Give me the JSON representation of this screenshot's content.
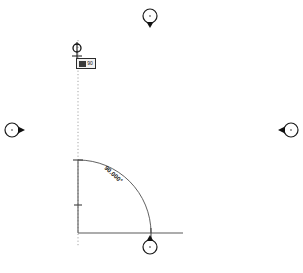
{
  "app": {
    "type": "cad-angular-dimension-editor",
    "background_color": "#ffffff",
    "line_color": "#555555",
    "construction_line_color": "#9a9a9a",
    "handle_color": "#1a1a1a"
  },
  "drawing": {
    "title": "Angular dimension",
    "center": {
      "x": 78,
      "y": 233
    },
    "radius": 73,
    "vertical_leg": {
      "x1": 78,
      "y1": 160,
      "x2": 78,
      "y2": 233
    },
    "horizontal_leg": {
      "x1": 78,
      "y1": 233,
      "x2": 183,
      "y2": 233
    },
    "construction_line": {
      "x": 78,
      "y_top": 40,
      "y_bottom": 246
    },
    "arc": {
      "start_x": 78,
      "start_y": 160,
      "end_x": 151,
      "end_y": 233
    }
  },
  "annotations": {
    "angle_label": "90.000°",
    "value_box": {
      "text": "90",
      "visible": true
    }
  },
  "handles": [
    {
      "name": "grip-top",
      "cx": 150,
      "cy": 17,
      "r": 7,
      "arrow": "down"
    },
    {
      "name": "grip-left",
      "cx": 13,
      "cy": 130,
      "r": 7,
      "arrow": "right"
    },
    {
      "name": "grip-right",
      "cx": 290,
      "cy": 130,
      "r": 7,
      "arrow": "left"
    },
    {
      "name": "grip-bottom",
      "cx": 150,
      "cy": 246,
      "r": 7,
      "arrow": "up"
    },
    {
      "name": "grip-selection",
      "cx": 77,
      "cy": 48,
      "r": 4,
      "arrow": "stem"
    }
  ],
  "ticks": [
    {
      "name": "tick-arc-start",
      "x": 78,
      "y": 160
    },
    {
      "name": "tick-mid-vertical",
      "x": 78,
      "y": 205
    },
    {
      "name": "tick-arc-end",
      "x": 151,
      "y": 233
    }
  ]
}
